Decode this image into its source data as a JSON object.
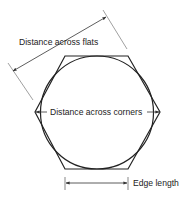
{
  "diagram": {
    "type": "hexagon-dimensions",
    "labels": {
      "flats": "Distance across flats",
      "corners": "Distance across corners",
      "edge": "Edge length"
    },
    "colors": {
      "shape_stroke": "#222222",
      "dimension_stroke": "#333333",
      "extension_stroke": "#888888",
      "background": "#ffffff"
    }
  }
}
